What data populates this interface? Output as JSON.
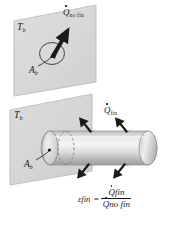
{
  "figure": {
    "name": "fin-effectiveness-diagram",
    "colors": {
      "wall_fill": "#d9d9d9",
      "wall_edge": "#b0b0b0",
      "cylinder_light": "#f2f2f2",
      "cylinder_mid": "#d2d2d2",
      "cylinder_dark": "#a8a8a8",
      "arrow_fill": "#1a1a1a",
      "ink": "#1a1a1a",
      "background": "#ffffff"
    }
  },
  "top_panel": {
    "wall_temperature_label": "T",
    "wall_temperature_sub": "b",
    "heat_rate_label": "Q",
    "heat_rate_sub": "no fin",
    "base_area_label": "A",
    "base_area_sub": "b"
  },
  "bottom_panel": {
    "wall_temperature_label": "T",
    "wall_temperature_sub": "b",
    "heat_rate_label": "Q",
    "heat_rate_sub": "fin",
    "base_area_label": "A",
    "base_area_sub": "b"
  },
  "equation": {
    "symbol": "ε",
    "symbol_sub": "fin",
    "equals": "=",
    "numerator": "Q",
    "numerator_sub": "fin",
    "denominator": "Q",
    "denominator_sub": "no fin"
  }
}
